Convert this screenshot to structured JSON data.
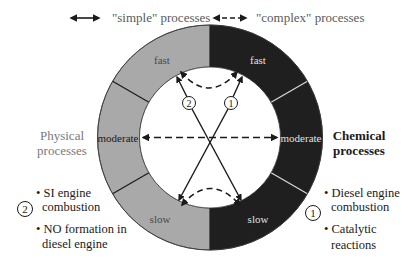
{
  "legend": {
    "simple_label": "\"simple\" processes",
    "complex_label": "\"complex\" processes"
  },
  "ring": {
    "physical_color": "#a9a9a9",
    "chemical_color": "#1f1f1f",
    "left_segments": [
      "fast",
      "moderate",
      "slow"
    ],
    "right_segments": [
      "fast",
      "moderate",
      "slow"
    ]
  },
  "markers": {
    "marker_1": "1",
    "marker_2": "2"
  },
  "left_panel": {
    "title_line1": "Physical",
    "title_line2": "processes",
    "marker": "2",
    "items": [
      {
        "line1": "• SI engine",
        "line2": "combustion"
      },
      {
        "line1": "• NO formation in",
        "line2": "diesel engine"
      }
    ]
  },
  "right_panel": {
    "title_line1": "Chemical",
    "title_line2": "processes",
    "marker": "1",
    "items": [
      {
        "line1": "• Diesel engine",
        "line2": "combustion"
      },
      {
        "line1": "• Catalytic",
        "line2": "reactions"
      }
    ]
  },
  "colors": {
    "text_gray": "#7a7a7a",
    "text_dark": "#1a1a1a",
    "line": "#1a1a1a"
  }
}
